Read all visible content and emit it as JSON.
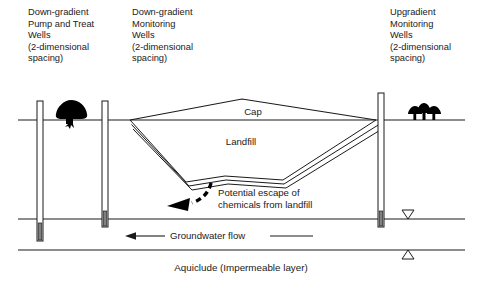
{
  "figure": {
    "width": 483,
    "height": 282,
    "background": "#ffffff",
    "line_color": "#1a1a1a",
    "text_color": "#1a1a1a",
    "well_screen_color": "#808080",
    "vegetation_color": "#000000"
  },
  "annotations": {
    "left_well_group": {
      "name": "down-gradient-pump-and-treat-wells",
      "lines": [
        "Down-gradient",
        "Pump and Treat",
        "Wells",
        "(2-dimensional",
        "spacing)"
      ]
    },
    "middle_well_group": {
      "name": "down-gradient-monitoring-wells",
      "lines": [
        "Down-gradient",
        "Monitoring",
        "Wells",
        "(2-dimensional",
        "spacing)"
      ]
    },
    "right_well_group": {
      "name": "upgradient-monitoring-wells",
      "lines": [
        "Upgradient",
        "Monitoring",
        "Wells",
        "(2-dimensional",
        "spacing)"
      ]
    }
  },
  "landfill": {
    "cap_label": "Cap",
    "body_label": "Landfill"
  },
  "escape": {
    "lines": [
      "Potential escape of",
      "chemicals from landfill"
    ]
  },
  "groundwater": {
    "flow_label": "Groundwater flow"
  },
  "aquiclude": {
    "label": "Aquiclude (Impermeable layer)"
  },
  "symbols": {
    "water_table_marker": "down-triangle-open",
    "aquiclude_marker": "up-triangle-open",
    "left_vegetation": "bush-silhouette",
    "right_vegetation": "three-trees-silhouette"
  },
  "wells": [
    {
      "name": "pump-and-treat-well",
      "x": 40,
      "label_group": "left_well_group"
    },
    {
      "name": "down-gradient-monitoring-well",
      "x": 105,
      "label_group": "middle_well_group"
    },
    {
      "name": "upgradient-monitoring-well",
      "x": 381,
      "label_group": "right_well_group"
    }
  ],
  "strata": {
    "ground_surface_y": 120,
    "water_table_y": 219,
    "aquiclude_y": 250
  }
}
